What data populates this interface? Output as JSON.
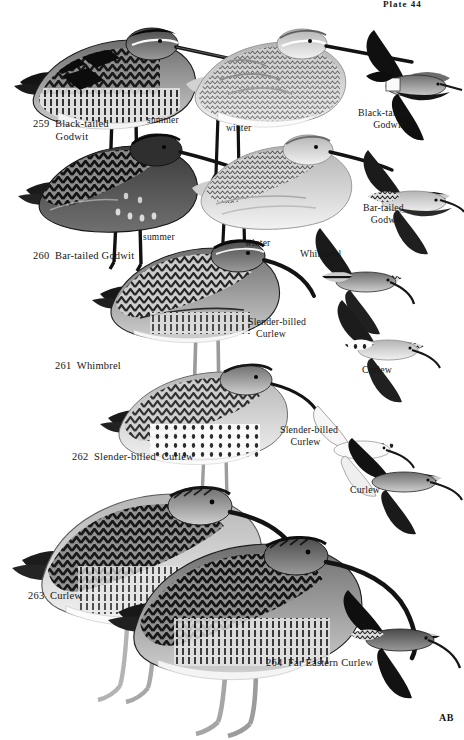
{
  "plate": {
    "header": "Plate 44",
    "signature": "AB",
    "background_color": "#ffffff",
    "ink_color": "#161616"
  },
  "species": [
    {
      "number": "259",
      "name": "Black-tailed\nGodwit",
      "name_flat": "Black-tailed Godwit",
      "flight_label": "Black-tailed\nGodwit",
      "plumages": [
        "summer",
        "winter"
      ]
    },
    {
      "number": "260",
      "name": "Bar-tailed Godwit",
      "name_flat": "Bar-tailed Godwit",
      "flight_label": "Bar-tailed\nGodwit",
      "plumages": [
        "summer",
        "winter"
      ]
    },
    {
      "number": "261",
      "name": "Whimbrel",
      "name_flat": "Whimbrel",
      "flight_label": "Whimbrel",
      "plumages": []
    },
    {
      "number": "262",
      "name": "Slender-billed  Curlew",
      "name_flat": "Slender-billed Curlew",
      "flight_label": "Slender-billed\nCurlew",
      "plumages": []
    },
    {
      "number": "263",
      "name": "Curlew",
      "name_flat": "Curlew",
      "flight_label": "Curlew",
      "plumages": []
    },
    {
      "number": "264",
      "name": "Far Eastern Curlew",
      "name_flat": "Far Eastern Curlew",
      "flight_label": "",
      "plumages": []
    }
  ],
  "labels": {
    "l259": "259  Black-tailed\n        Godwit",
    "l260": "260  Bar-tailed Godwit",
    "l261": "261  Whimbrel",
    "l262": "262  Slender-billed  Curlew",
    "l263": "263  Curlew",
    "l264": "264  Far Eastern Curlew",
    "summer1": "summer",
    "winter1": "winter",
    "summer2": "summer",
    "winter2": "winter",
    "fly_blacktailed": "Black-tailed\n    Godwit",
    "fly_bartailed": "Bar-tailed\n  Godwit",
    "fly_whimbrel": "Whimbrel",
    "fly_slender1": "Slender-billed\n   Curlew",
    "fly_curlew1": "Curlew",
    "fly_slender2": "Slender-billed\n    Curlew",
    "fly_curlew2": "Curlew"
  }
}
